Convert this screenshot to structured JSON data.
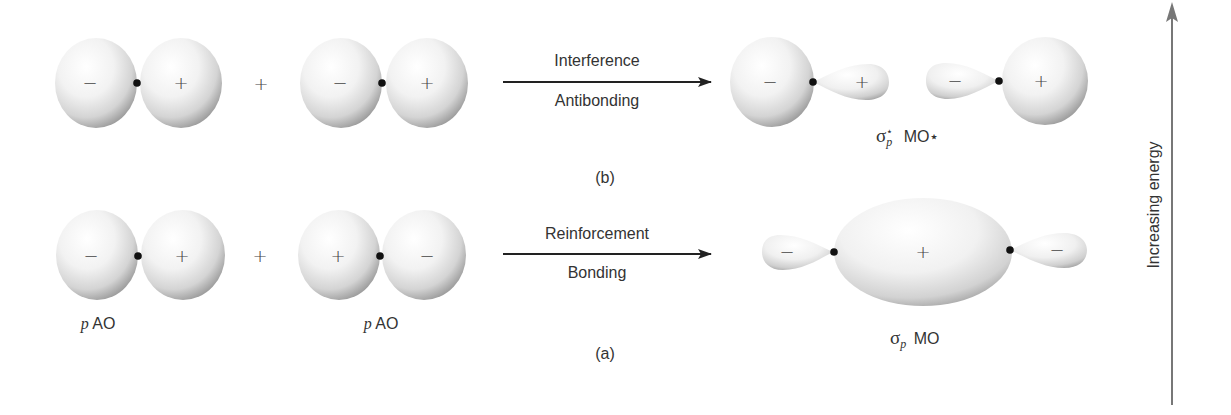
{
  "diagram": {
    "title_hidden": "Formation of sigma_p bonding and antibonding molecular orbitals from p atomic orbitals",
    "colors": {
      "orbital_highlight": "#ffffff",
      "orbital_shadow": "#8c8c8c",
      "nucleus": "#111111",
      "arrow": "#222222",
      "energy_arrow": "#777777",
      "text": "#333333"
    },
    "panel_b": {
      "caption": "(b)",
      "combine_sign": "+",
      "ao_left": {
        "left_lobe_sign": "−",
        "right_lobe_sign": "+"
      },
      "ao_right": {
        "left_lobe_sign": "−",
        "right_lobe_sign": "+"
      },
      "arrow_label_top": "Interference",
      "arrow_label_bottom": "Antibonding",
      "result": {
        "left_big_sign": "−",
        "left_small_sign": "+",
        "right_small_sign": "−",
        "right_big_sign": "+",
        "label_symbol": "σ",
        "label_sub": "p",
        "label_sup": "⋆",
        "label_text": "MO⋆"
      }
    },
    "panel_a": {
      "caption": "(a)",
      "combine_sign": "+",
      "ao_left": {
        "left_lobe_sign": "−",
        "right_lobe_sign": "+",
        "label_p": "p",
        "label_ao": "AO"
      },
      "ao_right": {
        "left_lobe_sign": "+",
        "right_lobe_sign": "−",
        "label_p": "p",
        "label_ao": "AO"
      },
      "arrow_label_top": "Reinforcement",
      "arrow_label_bottom": "Bonding",
      "result": {
        "left_small_sign": "−",
        "center_sign": "+",
        "right_small_sign": "−",
        "label_symbol": "σ",
        "label_sub": "p",
        "label_text": "MO"
      }
    },
    "energy_axis": {
      "label": "Increasing energy"
    }
  }
}
